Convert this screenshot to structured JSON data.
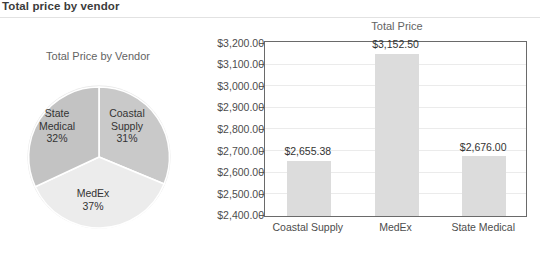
{
  "header": {
    "title": "Total price by vendor"
  },
  "pie_panel": {
    "title": "Total Price by Vendor"
  },
  "bar_panel": {
    "title": "Total Price"
  },
  "colors": {
    "slice_coastal": "#c9c9c9",
    "slice_medex": "#ececec",
    "slice_state": "#c3c3c3",
    "bar_fill": "#dcdcdc",
    "axis": "#6a6a6a",
    "gridline": "#ebebeb",
    "text": "#4d4d4d",
    "header_text": "#3c3c3c"
  },
  "chart_data": [
    {
      "type": "pie",
      "title": "Total Price by Vendor",
      "legend": "none",
      "labels": [
        "Coastal Supply",
        "MedEx",
        "State Medical"
      ],
      "values": [
        31,
        37,
        32
      ],
      "value_unit": "percent",
      "slice_labels": [
        {
          "name": "Coastal Supply",
          "line1": "Coastal",
          "line2": "Supply",
          "percent": "31%"
        },
        {
          "name": "MedEx",
          "line1": "MedEx",
          "line2": "",
          "percent": "37%"
        },
        {
          "name": "State Medical",
          "line1": "State",
          "line2": "Medical",
          "percent": "32%"
        }
      ]
    },
    {
      "type": "bar",
      "title": "Total Price",
      "xlabel": "",
      "ylabel": "",
      "categories": [
        "Coastal Supply",
        "MedEx",
        "State Medical"
      ],
      "values": [
        2655.38,
        3152.5,
        2676.0
      ],
      "data_labels": [
        "$2,655.38",
        "$3,152.50",
        "$2,676.00"
      ],
      "ylim": [
        2400,
        3200
      ],
      "ytick_step": 100,
      "ytick_labels": [
        "$3,200.00",
        "$3,100.00",
        "$3,000.00",
        "$2,900.00",
        "$2,800.00",
        "$2,700.00",
        "$2,600.00",
        "$2,500.00",
        "$2,400.00"
      ],
      "grid": true,
      "legend": "none"
    }
  ]
}
